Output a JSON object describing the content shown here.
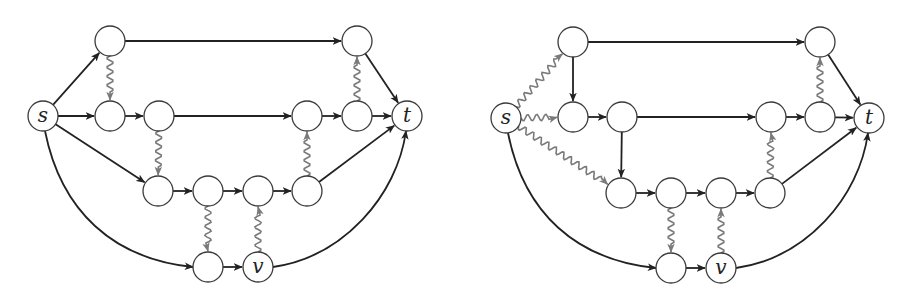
{
  "figure": {
    "panels": [
      {
        "id": "left",
        "nodes": [
          {
            "id": "s",
            "label": "s",
            "x": 43,
            "y": 116
          },
          {
            "id": "a1",
            "label": "",
            "x": 110,
            "y": 41
          },
          {
            "id": "a2",
            "label": "",
            "x": 357,
            "y": 41
          },
          {
            "id": "b1",
            "label": "",
            "x": 110,
            "y": 116
          },
          {
            "id": "b2",
            "label": "",
            "x": 159,
            "y": 116
          },
          {
            "id": "b3",
            "label": "",
            "x": 307,
            "y": 116
          },
          {
            "id": "b4",
            "label": "",
            "x": 357,
            "y": 116
          },
          {
            "id": "t",
            "label": "t",
            "x": 407,
            "y": 116
          },
          {
            "id": "c1",
            "label": "",
            "x": 158,
            "y": 191
          },
          {
            "id": "c2",
            "label": "",
            "x": 208,
            "y": 191
          },
          {
            "id": "c3",
            "label": "",
            "x": 258,
            "y": 191
          },
          {
            "id": "c4",
            "label": "",
            "x": 307,
            "y": 191
          },
          {
            "id": "d1",
            "label": "",
            "x": 208,
            "y": 267
          },
          {
            "id": "v",
            "label": "v",
            "x": 258,
            "y": 267
          }
        ],
        "edges": [
          {
            "from": "s",
            "to": "a1",
            "style": "solid"
          },
          {
            "from": "s",
            "to": "b1",
            "style": "solid"
          },
          {
            "from": "s",
            "to": "c1",
            "style": "solid"
          },
          {
            "from": "s",
            "to": "d1",
            "style": "solid",
            "curve": "arc"
          },
          {
            "from": "a1",
            "to": "a2",
            "style": "solid"
          },
          {
            "from": "a1",
            "to": "b1",
            "style": "wavy"
          },
          {
            "from": "a2",
            "to": "t",
            "style": "solid"
          },
          {
            "from": "b1",
            "to": "b2",
            "style": "solid"
          },
          {
            "from": "b2",
            "to": "b3",
            "style": "solid"
          },
          {
            "from": "b2",
            "to": "c1",
            "style": "wavy"
          },
          {
            "from": "b3",
            "to": "b4",
            "style": "solid"
          },
          {
            "from": "b4",
            "to": "t",
            "style": "solid"
          },
          {
            "from": "b4",
            "to": "a2",
            "style": "wavy"
          },
          {
            "from": "c1",
            "to": "c2",
            "style": "solid"
          },
          {
            "from": "c2",
            "to": "c3",
            "style": "solid"
          },
          {
            "from": "c3",
            "to": "c4",
            "style": "solid"
          },
          {
            "from": "c4",
            "to": "b3",
            "style": "wavy"
          },
          {
            "from": "c4",
            "to": "t",
            "style": "solid"
          },
          {
            "from": "c2",
            "to": "d1",
            "style": "wavy"
          },
          {
            "from": "d1",
            "to": "v",
            "style": "solid"
          },
          {
            "from": "v",
            "to": "c3",
            "style": "wavy"
          },
          {
            "from": "v",
            "to": "t",
            "style": "solid",
            "curve": "arc"
          }
        ]
      },
      {
        "id": "right",
        "nodes": [
          {
            "id": "s",
            "label": "s",
            "x": 506,
            "y": 118
          },
          {
            "id": "a1",
            "label": "",
            "x": 573,
            "y": 42
          },
          {
            "id": "a2",
            "label": "",
            "x": 820,
            "y": 42
          },
          {
            "id": "b1",
            "label": "",
            "x": 573,
            "y": 117
          },
          {
            "id": "b2",
            "label": "",
            "x": 622,
            "y": 117
          },
          {
            "id": "b3",
            "label": "",
            "x": 771,
            "y": 117
          },
          {
            "id": "b4",
            "label": "",
            "x": 820,
            "y": 117
          },
          {
            "id": "t",
            "label": "t",
            "x": 869,
            "y": 118
          },
          {
            "id": "c1",
            "label": "",
            "x": 621,
            "y": 193
          },
          {
            "id": "c2",
            "label": "",
            "x": 671,
            "y": 193
          },
          {
            "id": "c3",
            "label": "",
            "x": 721,
            "y": 193
          },
          {
            "id": "c4",
            "label": "",
            "x": 770,
            "y": 193
          },
          {
            "id": "d1",
            "label": "",
            "x": 671,
            "y": 268
          },
          {
            "id": "v",
            "label": "v",
            "x": 721,
            "y": 268
          }
        ],
        "edges": [
          {
            "from": "s",
            "to": "a1",
            "style": "wavy"
          },
          {
            "from": "s",
            "to": "b1",
            "style": "wavy"
          },
          {
            "from": "s",
            "to": "c1",
            "style": "wavy"
          },
          {
            "from": "s",
            "to": "d1",
            "style": "solid",
            "curve": "arc"
          },
          {
            "from": "a1",
            "to": "a2",
            "style": "solid"
          },
          {
            "from": "a1",
            "to": "b1",
            "style": "solid"
          },
          {
            "from": "a2",
            "to": "t",
            "style": "solid"
          },
          {
            "from": "b1",
            "to": "b2",
            "style": "solid"
          },
          {
            "from": "b2",
            "to": "b3",
            "style": "solid"
          },
          {
            "from": "b2",
            "to": "c1",
            "style": "solid"
          },
          {
            "from": "b3",
            "to": "b4",
            "style": "solid"
          },
          {
            "from": "b4",
            "to": "t",
            "style": "solid"
          },
          {
            "from": "b4",
            "to": "a2",
            "style": "wavy"
          },
          {
            "from": "c1",
            "to": "c2",
            "style": "solid"
          },
          {
            "from": "c2",
            "to": "c3",
            "style": "solid"
          },
          {
            "from": "c3",
            "to": "c4",
            "style": "solid"
          },
          {
            "from": "c4",
            "to": "b3",
            "style": "wavy"
          },
          {
            "from": "c4",
            "to": "t",
            "style": "solid"
          },
          {
            "from": "c2",
            "to": "d1",
            "style": "wavy"
          },
          {
            "from": "d1",
            "to": "v",
            "style": "solid"
          },
          {
            "from": "v",
            "to": "c3",
            "style": "wavy"
          },
          {
            "from": "v",
            "to": "t",
            "style": "solid",
            "curve": "arc"
          }
        ]
      }
    ],
    "colors": {
      "solid_edge": "#222222",
      "wavy_edge": "#7a7a7a",
      "node_stroke": "#3a3a3a",
      "node_fill": "#ffffff"
    },
    "node_radius": 15
  }
}
